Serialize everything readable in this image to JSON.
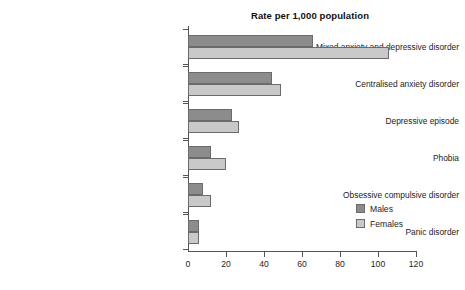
{
  "chart_data": {
    "type": "bar",
    "orientation": "horizontal",
    "title": "Rate per 1,000 population",
    "xlabel": "",
    "ylabel": "",
    "xlim": [
      0,
      120
    ],
    "xticks": [
      0,
      20,
      40,
      60,
      80,
      100,
      120
    ],
    "xtick_labels": [
      "0",
      "20",
      "40",
      "60",
      "80",
      "100",
      "120"
    ],
    "grid": false,
    "legend_position": "bottom-right",
    "categories": [
      "Mixed anxiety and depressive disorder",
      "Centralised anxiety disorder",
      "Depressive episode",
      "Phobia",
      "Obsessive compulsive disorder",
      "Panic disorder"
    ],
    "series": [
      {
        "name": "Males",
        "color": "#8c8c8c",
        "values": [
          66,
          44,
          23,
          12,
          8,
          6
        ]
      },
      {
        "name": "Females",
        "color": "#c9c9c9",
        "values": [
          106,
          49,
          27,
          20,
          12,
          6
        ]
      }
    ]
  },
  "legend": {
    "entries": [
      {
        "label": "Males",
        "swatch": "males-swatch"
      },
      {
        "label": "Females",
        "swatch": "females-swatch"
      }
    ]
  }
}
